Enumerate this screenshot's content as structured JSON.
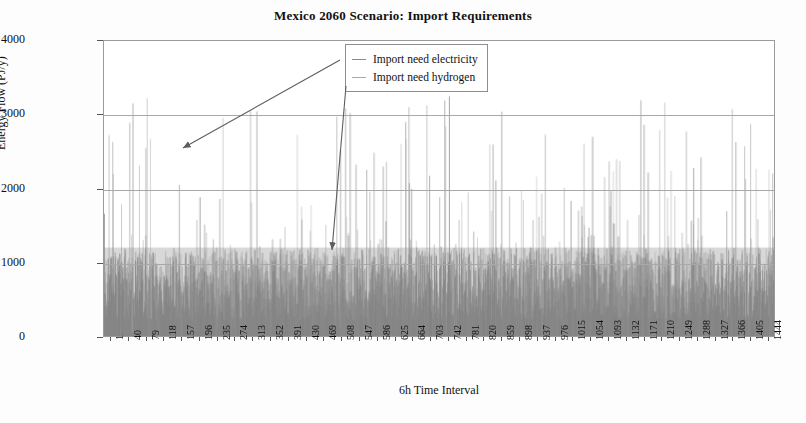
{
  "chart_data": {
    "type": "line",
    "title": "Mexico 2060 Scenario: Import Requirements",
    "xlabel": "6h Time Interval",
    "ylabel": "Energy Flow (PJ/y)",
    "ylim": [
      0,
      4000
    ],
    "xlim": [
      1,
      1460
    ],
    "yticks": [
      0,
      1000,
      2000,
      3000,
      4000
    ],
    "ytick_labels": [
      "0",
      "1000",
      "2000",
      "3000",
      "4000"
    ],
    "grid": true,
    "legend_position": "upper-center",
    "xtick_labels": [
      "1",
      "40",
      "79",
      "118",
      "157",
      "196",
      "235",
      "274",
      "313",
      "352",
      "391",
      "430",
      "469",
      "508",
      "547",
      "586",
      "625",
      "664",
      "703",
      "742",
      "781",
      "820",
      "859",
      "898",
      "937",
      "976",
      "1015",
      "1054",
      "1093",
      "1132",
      "1171",
      "1210",
      "1249",
      "1288",
      "1327",
      "1366",
      "1405",
      "1444"
    ],
    "xtick_values": [
      1,
      40,
      79,
      118,
      157,
      196,
      235,
      274,
      313,
      352,
      391,
      430,
      469,
      508,
      547,
      586,
      625,
      664,
      703,
      742,
      781,
      820,
      859,
      898,
      937,
      976,
      1015,
      1054,
      1093,
      1132,
      1171,
      1210,
      1249,
      1288,
      1327,
      1366,
      1405,
      1444
    ],
    "series": [
      {
        "name": "Import need electricity",
        "color": "#7f7f7f",
        "baseline_band_max": 1200,
        "typical_range": [
          0,
          1200
        ],
        "spike_max": 3300,
        "description": "Dense near-continuous band from 0 to about 1200 PJ/y across all 1460 intervals with sparse tall spikes reaching 2000-3300 PJ/y"
      },
      {
        "name": "Import need hydrogen",
        "color": "#a0a0a0",
        "baseline_band_max": 1150,
        "typical_range": [
          0,
          1150
        ],
        "spike_max": 3250,
        "description": "Overlapping dense band with intermittent spikes above 2000 PJ/y, concentrated in later intervals"
      }
    ],
    "annotations": [
      {
        "label": "Import need electricity",
        "from": [
          340,
          60
        ],
        "to": [
          183,
          148
        ]
      },
      {
        "label": "Import need hydrogen",
        "from": [
          346,
          86
        ],
        "to": [
          332,
          250
        ]
      }
    ]
  },
  "legend": {
    "items": [
      {
        "label": "Import need electricity",
        "marker": "line-marker-electricity"
      },
      {
        "label": "Import need hydrogen",
        "marker": "line-marker-hydrogen"
      }
    ]
  },
  "colors": {
    "electricity": "#7f7f7f",
    "hydrogen": "#a0a0a0",
    "frame": "#9a9a9a",
    "grid": "#a8a8a8",
    "text": "#111111"
  }
}
